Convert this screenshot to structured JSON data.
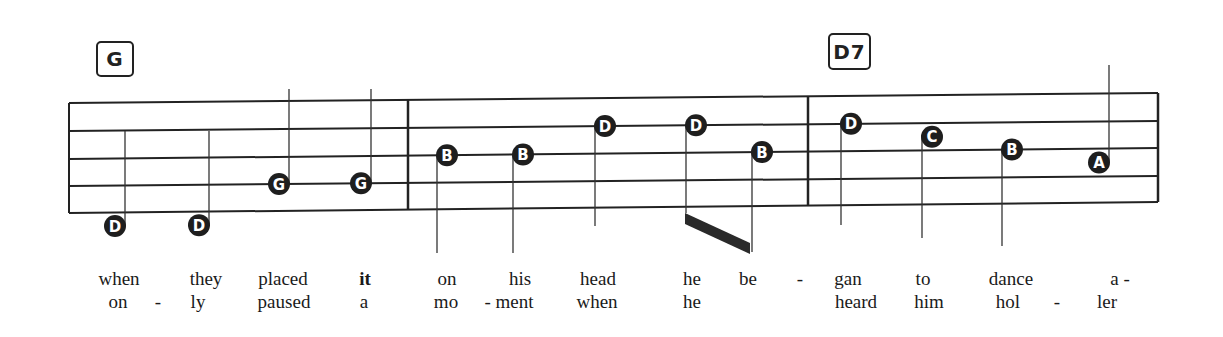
{
  "chords": [
    {
      "label": "G",
      "x": 96,
      "y": 41,
      "w": 38,
      "h": 36
    },
    {
      "label": "D7",
      "x": 828,
      "y": 33,
      "w": 43,
      "h": 37
    }
  ],
  "staff": {
    "left_x": 69,
    "right_x": 1158,
    "left_lines_y": [
      103,
      131,
      159,
      186,
      213
    ],
    "right_lines_y": [
      93,
      121,
      148,
      176,
      202
    ],
    "barlines_x": [
      408,
      808
    ],
    "line_color": "#222222"
  },
  "notes": [
    {
      "letter": "D",
      "x": 115,
      "line": 4.5,
      "stem": "up",
      "stem_end": 131
    },
    {
      "letter": "D",
      "x": 199,
      "line": 4.5,
      "stem": "up",
      "stem_end": 131
    },
    {
      "letter": "G",
      "x": 279,
      "line": 3,
      "stem": "up",
      "stem_end": 89
    },
    {
      "letter": "G",
      "x": 361,
      "line": 3,
      "stem": "up",
      "stem_end": 89
    },
    {
      "letter": "B",
      "x": 447,
      "line": 2,
      "stem": "down",
      "stem_end": 253
    },
    {
      "letter": "B",
      "x": 523,
      "line": 2,
      "stem": "down",
      "stem_end": 253
    },
    {
      "letter": "D",
      "x": 605,
      "line": 1,
      "stem": "down",
      "stem_end": 226
    },
    {
      "letter": "D",
      "x": 696,
      "line": 1,
      "stem": "down",
      "stem_end": 213
    },
    {
      "letter": "B",
      "x": 762,
      "line": 2,
      "stem": "down",
      "stem_end": 252
    },
    {
      "letter": "D",
      "x": 851,
      "line": 1,
      "stem": "down",
      "stem_end": 225
    },
    {
      "letter": "C",
      "x": 932,
      "line": 1.5,
      "stem": "down",
      "stem_end": 238
    },
    {
      "letter": "B",
      "x": 1012,
      "line": 2,
      "stem": "down",
      "stem_end": 246
    },
    {
      "letter": "A",
      "x": 1099,
      "line": 2.5,
      "stem": "up",
      "stem_end": 65
    }
  ],
  "beam": {
    "x1": 685,
    "y1": 213,
    "x2": 750,
    "y2": 243,
    "thickness": 11
  },
  "lyrics": {
    "verse1": [
      {
        "text": "when",
        "x": 119
      },
      {
        "text": "they",
        "x": 206
      },
      {
        "text": "placed",
        "x": 283
      },
      {
        "text": "it",
        "x": 365,
        "bold": true
      },
      {
        "text": "on",
        "x": 447
      },
      {
        "text": "his",
        "x": 520
      },
      {
        "text": "head",
        "x": 598
      },
      {
        "text": "he",
        "x": 692
      },
      {
        "text": "be",
        "x": 748
      },
      {
        "text": "-",
        "x": 800
      },
      {
        "text": "gan",
        "x": 848
      },
      {
        "text": "to",
        "x": 923
      },
      {
        "text": "dance",
        "x": 1011
      },
      {
        "text": "a -",
        "x": 1120
      }
    ],
    "verse2": [
      {
        "text": "on",
        "x": 118
      },
      {
        "text": "-",
        "x": 158
      },
      {
        "text": "ly",
        "x": 198
      },
      {
        "text": "paused",
        "x": 284
      },
      {
        "text": "a",
        "x": 364
      },
      {
        "text": "mo",
        "x": 446
      },
      {
        "text": "- ment",
        "x": 509
      },
      {
        "text": "when",
        "x": 597
      },
      {
        "text": "he",
        "x": 692
      },
      {
        "text": "heard",
        "x": 856
      },
      {
        "text": "him",
        "x": 929
      },
      {
        "text": "hol",
        "x": 1008
      },
      {
        "text": "-",
        "x": 1057
      },
      {
        "text": "ler",
        "x": 1107
      }
    ]
  }
}
